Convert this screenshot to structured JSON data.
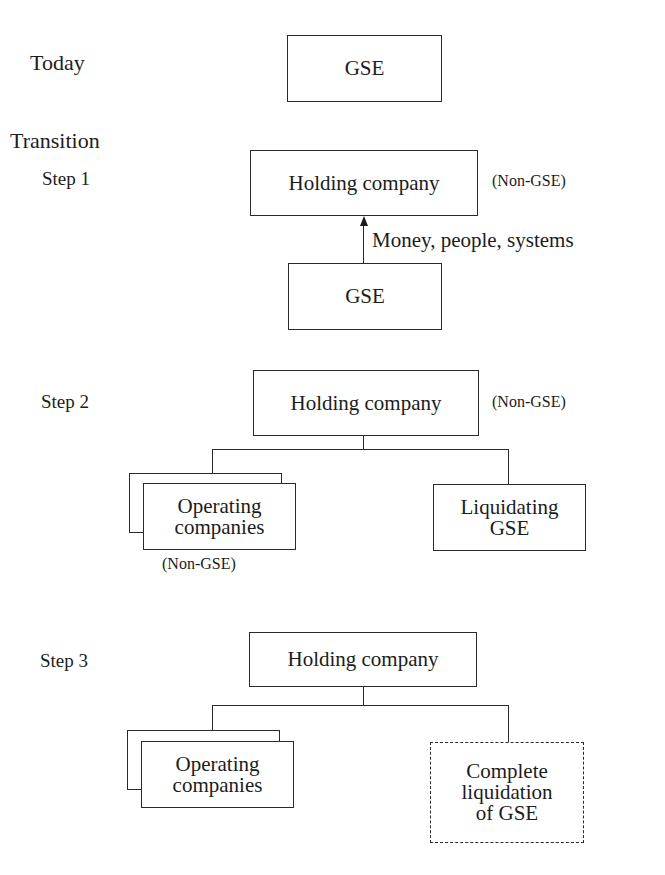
{
  "diagram": {
    "rows": {
      "today": {
        "label": "Today",
        "box": "GSE"
      },
      "transition": {
        "label": "Transition"
      },
      "step1": {
        "label": "Step 1",
        "parent_box": "Holding company",
        "parent_note": "(Non-GSE)",
        "child_box": "GSE",
        "arrow_label": "Money, people, systems"
      },
      "step2": {
        "label": "Step 2",
        "parent_box": "Holding company",
        "parent_note": "(Non-GSE)",
        "left_child": {
          "line1": "Operating",
          "line2": "companies",
          "note": "(Non-GSE)",
          "stacked": true
        },
        "right_child": {
          "line1": "Liquidating",
          "line2": "GSE"
        }
      },
      "step3": {
        "label": "Step 3",
        "parent_box": "Holding company",
        "left_child": {
          "line1": "Operating",
          "line2": "companies",
          "stacked": true
        },
        "right_child": {
          "line1": "Complete",
          "line2": "liquidation",
          "line3": "of GSE",
          "style": "dashed"
        }
      }
    },
    "colors": {
      "line": "#2a2a2a",
      "text": "#1c1c1c",
      "background": "#ffffff"
    }
  }
}
